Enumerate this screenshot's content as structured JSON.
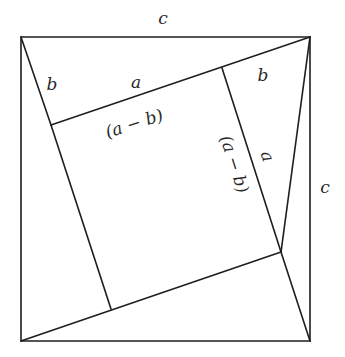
{
  "diagram": {
    "stroke_color": "#1e1e1e",
    "background": "#ffffff",
    "outer_square": {
      "points": [
        [
          21,
          37
        ],
        [
          310,
          37
        ],
        [
          310,
          341
        ],
        [
          21,
          341
        ]
      ]
    },
    "inner_square": {
      "points": [
        [
          51,
          125
        ],
        [
          222,
          68
        ],
        [
          281,
          252
        ],
        [
          111,
          309
        ]
      ]
    },
    "segments": [
      {
        "name": "top-left-to-inner-tl",
        "from": [
          21,
          37
        ],
        "to": [
          51,
          125
        ]
      },
      {
        "name": "top-right-to-inner-tl",
        "from": [
          310,
          37
        ],
        "to": [
          51,
          125
        ]
      },
      {
        "name": "top-right-to-inner-br",
        "from": [
          310,
          37
        ],
        "to": [
          281,
          252
        ]
      },
      {
        "name": "inner-tr-to-inner-br",
        "from": [
          222,
          68
        ],
        "to": [
          281,
          252
        ]
      },
      {
        "name": "bottom-right-to-inner-br",
        "from": [
          310,
          341
        ],
        "to": [
          281,
          252
        ]
      },
      {
        "name": "bottom-left-to-inner-br",
        "from": [
          21,
          341
        ],
        "to": [
          281,
          252
        ]
      },
      {
        "name": "inner-tl-to-inner-bl",
        "from": [
          51,
          125
        ],
        "to": [
          111,
          309
        ]
      }
    ],
    "labels": {
      "top_c": {
        "text": "c",
        "x": 163,
        "y": 24,
        "rotate": 0
      },
      "right_c": {
        "text": "c",
        "x": 325,
        "y": 193,
        "rotate": 0
      },
      "left_b": {
        "text": "b",
        "x": 52,
        "y": 90,
        "rotate": 0
      },
      "top_a": {
        "text": "a",
        "x": 136,
        "y": 88,
        "rotate": 0
      },
      "right_b": {
        "text": "b",
        "x": 263,
        "y": 81,
        "rotate": 0
      },
      "inner_top_amb": {
        "text": "(a − b)",
        "x": 136,
        "y": 129,
        "rotate": -18
      },
      "inner_right_amb": {
        "text": "(a − b)",
        "x": 229,
        "y": 166,
        "rotate": 72
      },
      "right_a": {
        "text": "a",
        "x": 262,
        "y": 158,
        "rotate": 72
      }
    }
  }
}
